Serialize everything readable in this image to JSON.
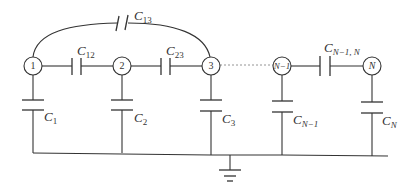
{
  "diagram": {
    "type": "capacitance network",
    "nodes": [
      {
        "id": "node-1",
        "label": "1"
      },
      {
        "id": "node-2",
        "label": "2"
      },
      {
        "id": "node-3",
        "label": "3"
      },
      {
        "id": "node-n-minus-1",
        "label": "N−1"
      },
      {
        "id": "node-n",
        "label": "N"
      }
    ],
    "mutual_capacitors": [
      {
        "id": "c13",
        "base": "C",
        "sub": "13",
        "between": [
          "1",
          "3"
        ]
      },
      {
        "id": "c12",
        "base": "C",
        "sub": "12",
        "between": [
          "1",
          "2"
        ]
      },
      {
        "id": "c23",
        "base": "C",
        "sub": "23",
        "between": [
          "2",
          "3"
        ]
      },
      {
        "id": "cn1n",
        "base": "C",
        "sub": "N−1, N",
        "between": [
          "N−1",
          "N"
        ]
      }
    ],
    "ground_capacitors": [
      {
        "id": "c1",
        "base": "C",
        "sub": "1"
      },
      {
        "id": "c2",
        "base": "C",
        "sub": "2"
      },
      {
        "id": "c3",
        "base": "C",
        "sub": "3"
      },
      {
        "id": "cn1",
        "base": "C",
        "sub": "N−1"
      },
      {
        "id": "cn",
        "base": "C",
        "sub": "N"
      }
    ],
    "ground": "ground-symbol",
    "colors": {
      "line": "#333333",
      "background": "#ffffff",
      "dotted": "#888888"
    }
  }
}
